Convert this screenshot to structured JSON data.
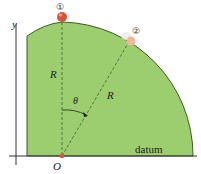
{
  "diagram": {
    "axis_label": "y",
    "radius_label_vertical": "R",
    "radius_label_slanted": "R",
    "angle_label": "θ",
    "origin_label": "O",
    "datum_label": "datum",
    "position_1_label": "①",
    "position_2_label": "②",
    "colors": {
      "surface_fill": "#9ccd6e",
      "surface_edge": "#3f5a2c",
      "ball_1": "#d8553a",
      "ball_2": "#f2b59b",
      "axis": "#333333"
    }
  }
}
